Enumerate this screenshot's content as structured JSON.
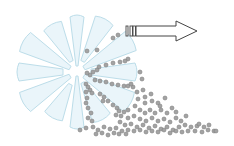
{
  "diagram": {
    "colors": {
      "background": "#ffffff",
      "blade_fill": "#eaf5fa",
      "blade_stroke": "#bcdde9",
      "particle_fill": "#a3a3a3",
      "particle_stroke": "#7d7d7d",
      "arrow_stroke": "#444444",
      "arrow_fill": "#ffffff"
    },
    "wheel": {
      "cx": 77,
      "cy": 72
    },
    "arrow": {
      "direction": "right",
      "bars_x": [
        126,
        130,
        133
      ],
      "shaft_start_x": 136,
      "head_start_x": 176,
      "tip_x": 197,
      "y": 31
    },
    "particles": [
      [
        113,
        38
      ],
      [
        118,
        35
      ],
      [
        87,
        51
      ],
      [
        97,
        50
      ],
      [
        128,
        59
      ],
      [
        125,
        61
      ],
      [
        120,
        62
      ],
      [
        113,
        63
      ],
      [
        106,
        65
      ],
      [
        99,
        67
      ],
      [
        93,
        72
      ],
      [
        97,
        70
      ],
      [
        90,
        75
      ],
      [
        87,
        73
      ],
      [
        140,
        72
      ],
      [
        142,
        79
      ],
      [
        95,
        80
      ],
      [
        100,
        81
      ],
      [
        106,
        82
      ],
      [
        112,
        84
      ],
      [
        118,
        85
      ],
      [
        124,
        86
      ],
      [
        128,
        86
      ],
      [
        133,
        87
      ],
      [
        131,
        84
      ],
      [
        86,
        84
      ],
      [
        88,
        87
      ],
      [
        90,
        90
      ],
      [
        86,
        92
      ],
      [
        92,
        93
      ],
      [
        100,
        94
      ],
      [
        104,
        97
      ],
      [
        108,
        101
      ],
      [
        103,
        101
      ],
      [
        137,
        92
      ],
      [
        143,
        90
      ],
      [
        145,
        97
      ],
      [
        151,
        94
      ],
      [
        138,
        99
      ],
      [
        145,
        103
      ],
      [
        152,
        101
      ],
      [
        158,
        103
      ],
      [
        165,
        98
      ],
      [
        160,
        106
      ],
      [
        87,
        98
      ],
      [
        86,
        103
      ],
      [
        88,
        108
      ],
      [
        91,
        113
      ],
      [
        88,
        118
      ],
      [
        92,
        121
      ],
      [
        113,
        105
      ],
      [
        117,
        108
      ],
      [
        119,
        111
      ],
      [
        116,
        115
      ],
      [
        121,
        116
      ],
      [
        124,
        112
      ],
      [
        128,
        110
      ],
      [
        135,
        106
      ],
      [
        140,
        110
      ],
      [
        145,
        113
      ],
      [
        150,
        110
      ],
      [
        155,
        113
      ],
      [
        161,
        110
      ],
      [
        167,
        113
      ],
      [
        172,
        108
      ],
      [
        176,
        112
      ],
      [
        128,
        118
      ],
      [
        134,
        116
      ],
      [
        140,
        119
      ],
      [
        146,
        121
      ],
      [
        152,
        118
      ],
      [
        158,
        121
      ],
      [
        164,
        119
      ],
      [
        170,
        122
      ],
      [
        176,
        118
      ],
      [
        181,
        121
      ],
      [
        186,
        116
      ],
      [
        120,
        122
      ],
      [
        125,
        125
      ],
      [
        131,
        124
      ],
      [
        137,
        127
      ],
      [
        143,
        125
      ],
      [
        149,
        128
      ],
      [
        155,
        126
      ],
      [
        161,
        129
      ],
      [
        167,
        127
      ],
      [
        173,
        130
      ],
      [
        179,
        127
      ],
      [
        185,
        125
      ],
      [
        191,
        127
      ],
      [
        197,
        126
      ],
      [
        199,
        124
      ],
      [
        204,
        127
      ],
      [
        209,
        125
      ],
      [
        214,
        131
      ],
      [
        80,
        130
      ],
      [
        86,
        128
      ],
      [
        93,
        127
      ],
      [
        98,
        130
      ],
      [
        104,
        127
      ],
      [
        110,
        129
      ],
      [
        116,
        128
      ],
      [
        122,
        131
      ],
      [
        128,
        130
      ],
      [
        134,
        131
      ],
      [
        140,
        130
      ],
      [
        146,
        132
      ],
      [
        152,
        131
      ],
      [
        158,
        132
      ],
      [
        164,
        130
      ],
      [
        170,
        133
      ],
      [
        176,
        131
      ],
      [
        182,
        132
      ],
      [
        188,
        131
      ],
      [
        195,
        131
      ],
      [
        202,
        132
      ],
      [
        208,
        130
      ],
      [
        216,
        131
      ],
      [
        96,
        134
      ],
      [
        102,
        133
      ],
      [
        108,
        135
      ],
      [
        114,
        133
      ],
      [
        119,
        134
      ],
      [
        126,
        134
      ]
    ]
  }
}
